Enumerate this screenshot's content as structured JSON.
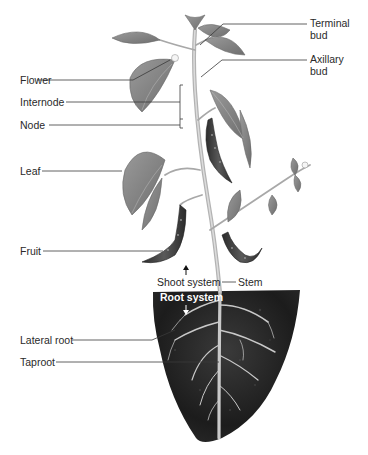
{
  "figure": {
    "labels": {
      "terminal_bud_line1": "Terminal",
      "terminal_bud_line2": "bud",
      "axillary_bud_line1": "Axillary",
      "axillary_bud_line2": "bud",
      "flower": "Flower",
      "internode": "Internode",
      "node": "Node",
      "leaf": "Leaf",
      "fruit": "Fruit",
      "shoot_system": "Shoot system",
      "stem": "Stem",
      "root_system": "Root system",
      "lateral_root": "Lateral root",
      "taproot": "Taproot"
    },
    "colors": {
      "background": "#ffffff",
      "soil": "#1f1f1f",
      "leaf": "#8a8a8a",
      "stem": "#b5b5b5",
      "fruit": "#3a3a3a",
      "root": "#c8c8c8",
      "leader_line": "#333333"
    }
  }
}
